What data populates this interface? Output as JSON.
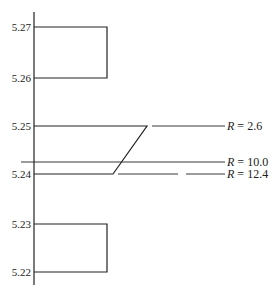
{
  "diagram": {
    "axis": {
      "ticks": [
        {
          "label": "5.27",
          "y": 27
        },
        {
          "label": "5.26",
          "y": 78
        },
        {
          "label": "5.25",
          "y": 126
        },
        {
          "label": "5.24",
          "y": 174
        },
        {
          "label": "5.23",
          "y": 224
        },
        {
          "label": "5.22",
          "y": 272
        }
      ]
    },
    "levels": [
      {
        "symbol": "R",
        "eq": " = ",
        "value": "2.6"
      },
      {
        "symbol": "R",
        "eq": " = ",
        "value": "10.0"
      },
      {
        "symbol": "R",
        "eq": " = ",
        "value": "12.4"
      }
    ]
  }
}
